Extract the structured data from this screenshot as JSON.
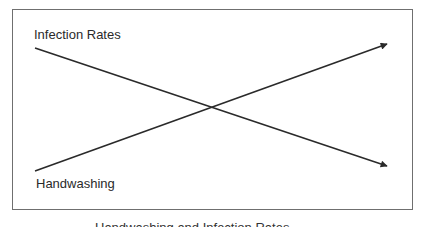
{
  "diagram": {
    "labels": {
      "infection_rates": "Infection Rates",
      "handwashing": "Handwashing"
    },
    "lines": [
      {
        "name": "Infection Rates",
        "direction": "decreasing",
        "from": [
          35,
          48
        ],
        "to": [
          387,
          166
        ]
      },
      {
        "name": "Handwashing",
        "direction": "increasing",
        "from": [
          35,
          171
        ],
        "to": [
          387,
          44
        ]
      }
    ],
    "caption_cropped": "Handwashing and Infection Rates",
    "colors": {
      "line": "#2a2a2a",
      "frame": "#6f6f6f",
      "background": "#ffffff"
    }
  }
}
